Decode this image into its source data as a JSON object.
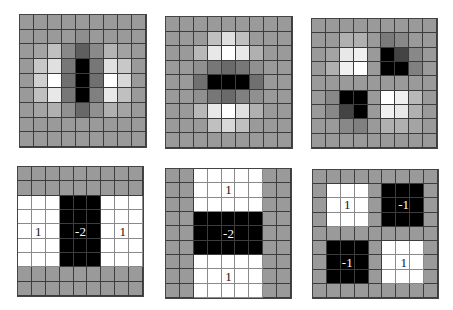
{
  "figure": {
    "grid_size": 9,
    "colors": {
      "gray": "#9a9a9a",
      "white": "#ffffff",
      "black": "#000000",
      "grid_line": "#3c3c3c"
    },
    "learned_filters": [
      {
        "name": "vertical-edge-filter",
        "x": 19,
        "y": 14,
        "w": 128,
        "h": 134,
        "cells": [
          [
            "#9a9a9a",
            "#9a9a9a",
            "#9a9a9a",
            "#9a9a9a",
            "#9a9a9a",
            "#9a9a9a",
            "#9a9a9a",
            "#9a9a9a",
            "#9a9a9a"
          ],
          [
            "#9a9a9a",
            "#9a9a9a",
            "#9a9a9a",
            "#9a9a9a",
            "#8e8e8e",
            "#9a9a9a",
            "#9a9a9a",
            "#9a9a9a",
            "#9a9a9a"
          ],
          [
            "#9a9a9a",
            "#a4a4a4",
            "#c0c0c0",
            "#888888",
            "#5e5e5e",
            "#8a8a8a",
            "#b4b4b4",
            "#a2a2a2",
            "#9a9a9a"
          ],
          [
            "#9a9a9a",
            "#c8c8c8",
            "#e0e0e0",
            "#777777",
            "#000000",
            "#777777",
            "#e0e0e0",
            "#c8c8c8",
            "#9a9a9a"
          ],
          [
            "#9a9a9a",
            "#d0d0d0",
            "#ffffff",
            "#707070",
            "#000000",
            "#707070",
            "#ffffff",
            "#d8d8d8",
            "#9a9a9a"
          ],
          [
            "#9a9a9a",
            "#c0c0c0",
            "#e8e8e8",
            "#777777",
            "#000000",
            "#808080",
            "#e8e8e8",
            "#c0c0c0",
            "#9a9a9a"
          ],
          [
            "#9a9a9a",
            "#a4a4a4",
            "#b0b0b0",
            "#909090",
            "#686868",
            "#909090",
            "#b0b0b0",
            "#a4a4a4",
            "#9a9a9a"
          ],
          [
            "#9a9a9a",
            "#9a9a9a",
            "#9a9a9a",
            "#9a9a9a",
            "#9a9a9a",
            "#9a9a9a",
            "#9a9a9a",
            "#9a9a9a",
            "#9a9a9a"
          ],
          [
            "#9a9a9a",
            "#9a9a9a",
            "#9a9a9a",
            "#9a9a9a",
            "#9a9a9a",
            "#9a9a9a",
            "#9a9a9a",
            "#9a9a9a",
            "#9a9a9a"
          ]
        ]
      },
      {
        "name": "horizontal-edge-filter",
        "x": 165,
        "y": 16,
        "w": 128,
        "h": 133,
        "cells": [
          [
            "#9a9a9a",
            "#9a9a9a",
            "#9a9a9a",
            "#9a9a9a",
            "#9a9a9a",
            "#9a9a9a",
            "#9a9a9a",
            "#9a9a9a",
            "#9a9a9a"
          ],
          [
            "#9a9a9a",
            "#9a9a9a",
            "#9a9a9a",
            "#c0c0c0",
            "#e0e0e0",
            "#c0c0c0",
            "#9a9a9a",
            "#9a9a9a",
            "#9a9a9a"
          ],
          [
            "#9a9a9a",
            "#9a9a9a",
            "#b8b8b8",
            "#e8e8e8",
            "#ffffff",
            "#e8e8e8",
            "#b0b0b0",
            "#9a9a9a",
            "#9a9a9a"
          ],
          [
            "#9a9a9a",
            "#9a9a9a",
            "#909090",
            "#777777",
            "#6a6a6a",
            "#777777",
            "#909090",
            "#9a9a9a",
            "#9a9a9a"
          ],
          [
            "#9a9a9a",
            "#9a9a9a",
            "#707070",
            "#000000",
            "#000000",
            "#000000",
            "#707070",
            "#9a9a9a",
            "#9a9a9a"
          ],
          [
            "#9a9a9a",
            "#9a9a9a",
            "#909090",
            "#777777",
            "#6a6a6a",
            "#808080",
            "#909090",
            "#9a9a9a",
            "#9a9a9a"
          ],
          [
            "#9a9a9a",
            "#9a9a9a",
            "#b8b8b8",
            "#e8e8e8",
            "#ffffff",
            "#e0e0e0",
            "#b0b0b0",
            "#9a9a9a",
            "#9a9a9a"
          ],
          [
            "#9a9a9a",
            "#9a9a9a",
            "#9a9a9a",
            "#c0c0c0",
            "#d8d8d8",
            "#c0c0c0",
            "#9a9a9a",
            "#9a9a9a",
            "#9a9a9a"
          ],
          [
            "#9a9a9a",
            "#9a9a9a",
            "#9a9a9a",
            "#9a9a9a",
            "#9a9a9a",
            "#9a9a9a",
            "#9a9a9a",
            "#9a9a9a",
            "#9a9a9a"
          ]
        ]
      },
      {
        "name": "checkerboard-filter",
        "x": 311,
        "y": 18,
        "w": 127,
        "h": 131,
        "cells": [
          [
            "#9a9a9a",
            "#9a9a9a",
            "#9a9a9a",
            "#9a9a9a",
            "#9a9a9a",
            "#9a9a9a",
            "#9a9a9a",
            "#9a9a9a",
            "#9a9a9a"
          ],
          [
            "#9a9a9a",
            "#9a9a9a",
            "#b0b0b0",
            "#b0b0b0",
            "#9a9a9a",
            "#7a7a7a",
            "#888888",
            "#9a9a9a",
            "#9a9a9a"
          ],
          [
            "#9a9a9a",
            "#a4a4a4",
            "#e8e8e8",
            "#f0f0f0",
            "#9a9a9a",
            "#000000",
            "#444444",
            "#888888",
            "#9a9a9a"
          ],
          [
            "#9a9a9a",
            "#b0b0b0",
            "#f0f0f0",
            "#ffffff",
            "#9a9a9a",
            "#000000",
            "#000000",
            "#808080",
            "#9a9a9a"
          ],
          [
            "#9a9a9a",
            "#9a9a9a",
            "#9a9a9a",
            "#9a9a9a",
            "#9a9a9a",
            "#9a9a9a",
            "#9a9a9a",
            "#9a9a9a",
            "#9a9a9a"
          ],
          [
            "#9a9a9a",
            "#888888",
            "#000000",
            "#000000",
            "#9a9a9a",
            "#ffffff",
            "#f0f0f0",
            "#b8b8b8",
            "#9a9a9a"
          ],
          [
            "#9a9a9a",
            "#888888",
            "#444444",
            "#000000",
            "#9a9a9a",
            "#f0f0f0",
            "#e8e8e8",
            "#b0b0b0",
            "#9a9a9a"
          ],
          [
            "#9a9a9a",
            "#9a9a9a",
            "#888888",
            "#808080",
            "#9a9a9a",
            "#b0b0b0",
            "#b0b0b0",
            "#a4a4a4",
            "#9a9a9a"
          ],
          [
            "#9a9a9a",
            "#9a9a9a",
            "#9a9a9a",
            "#9a9a9a",
            "#9a9a9a",
            "#9a9a9a",
            "#9a9a9a",
            "#9a9a9a",
            "#9a9a9a"
          ]
        ]
      }
    ],
    "haar_filters": [
      {
        "name": "vertical-haar-filter",
        "x": 17,
        "y": 166,
        "w": 127,
        "h": 131,
        "cells": [
          [
            "g",
            "g",
            "g",
            "g",
            "g",
            "g",
            "g",
            "g",
            "g"
          ],
          [
            "g",
            "g",
            "g",
            "g",
            "g",
            "g",
            "g",
            "g",
            "g"
          ],
          [
            "w",
            "w",
            "w",
            "b",
            "b",
            "b",
            "w",
            "w",
            "w"
          ],
          [
            "w",
            "w",
            "w",
            "b",
            "b",
            "b",
            "w",
            "w",
            "w"
          ],
          [
            "w",
            "w",
            "w",
            "b",
            "b",
            "b",
            "w",
            "w",
            "w"
          ],
          [
            "w",
            "w",
            "w",
            "b",
            "b",
            "b",
            "w",
            "w",
            "w"
          ],
          [
            "w",
            "w",
            "w",
            "b",
            "b",
            "b",
            "w",
            "w",
            "w"
          ],
          [
            "g",
            "g",
            "g",
            "g",
            "g",
            "g",
            "g",
            "g",
            "g"
          ],
          [
            "g",
            "g",
            "g",
            "g",
            "g",
            "g",
            "g",
            "g",
            "g"
          ]
        ],
        "labels": [
          {
            "text": "1",
            "row": 4,
            "col": 1,
            "style": "dark"
          },
          {
            "text": "-2",
            "row": 4,
            "col": 4,
            "style": "light"
          },
          {
            "text": "1",
            "row": 4,
            "col": 7,
            "style": "dark"
          }
        ]
      },
      {
        "name": "horizontal-haar-filter",
        "x": 165,
        "y": 168,
        "w": 127,
        "h": 131,
        "cells": [
          [
            "g",
            "g",
            "w",
            "w",
            "w",
            "w",
            "w",
            "g",
            "g"
          ],
          [
            "g",
            "g",
            "w",
            "w",
            "w",
            "w",
            "w",
            "g",
            "g"
          ],
          [
            "g",
            "g",
            "w",
            "w",
            "w",
            "w",
            "w",
            "g",
            "g"
          ],
          [
            "g",
            "g",
            "b",
            "b",
            "b",
            "b",
            "b",
            "g",
            "g"
          ],
          [
            "g",
            "g",
            "b",
            "b",
            "b",
            "b",
            "b",
            "g",
            "g"
          ],
          [
            "g",
            "g",
            "b",
            "b",
            "b",
            "b",
            "b",
            "g",
            "g"
          ],
          [
            "g",
            "g",
            "w",
            "w",
            "w",
            "w",
            "w",
            "g",
            "g"
          ],
          [
            "g",
            "g",
            "w",
            "w",
            "w",
            "w",
            "w",
            "g",
            "g"
          ],
          [
            "g",
            "g",
            "w",
            "w",
            "w",
            "w",
            "w",
            "g",
            "g"
          ]
        ],
        "labels": [
          {
            "text": "1",
            "row": 1,
            "col": 4,
            "style": "dark"
          },
          {
            "text": "-2",
            "row": 4,
            "col": 4,
            "style": "light"
          },
          {
            "text": "1",
            "row": 7,
            "col": 4,
            "style": "dark"
          }
        ]
      },
      {
        "name": "checkerboard-haar-filter",
        "x": 312,
        "y": 169,
        "w": 127,
        "h": 130,
        "cells": [
          [
            "g",
            "g",
            "g",
            "g",
            "g",
            "g",
            "g",
            "g",
            "g"
          ],
          [
            "g",
            "w",
            "w",
            "w",
            "g",
            "b",
            "b",
            "b",
            "g"
          ],
          [
            "g",
            "w",
            "w",
            "w",
            "g",
            "b",
            "b",
            "b",
            "g"
          ],
          [
            "g",
            "w",
            "w",
            "w",
            "g",
            "b",
            "b",
            "b",
            "g"
          ],
          [
            "g",
            "g",
            "g",
            "g",
            "g",
            "g",
            "g",
            "g",
            "g"
          ],
          [
            "g",
            "b",
            "b",
            "b",
            "g",
            "w",
            "w",
            "w",
            "g"
          ],
          [
            "g",
            "b",
            "b",
            "b",
            "g",
            "w",
            "w",
            "w",
            "g"
          ],
          [
            "g",
            "b",
            "b",
            "b",
            "g",
            "w",
            "w",
            "w",
            "g"
          ],
          [
            "g",
            "g",
            "g",
            "g",
            "g",
            "g",
            "g",
            "g",
            "g"
          ]
        ],
        "labels": [
          {
            "text": "1",
            "row": 2,
            "col": 2,
            "style": "dark"
          },
          {
            "text": "-1",
            "row": 2,
            "col": 6,
            "style": "light"
          },
          {
            "text": "-1",
            "row": 6,
            "col": 2,
            "style": "light"
          },
          {
            "text": "1",
            "row": 6,
            "col": 6,
            "style": "dark"
          }
        ]
      }
    ]
  }
}
